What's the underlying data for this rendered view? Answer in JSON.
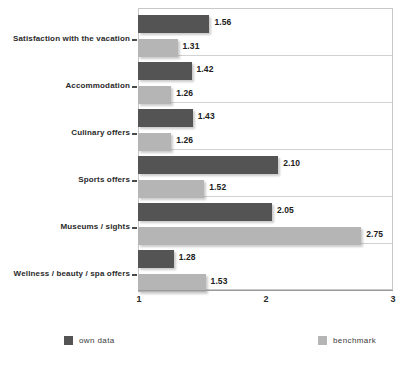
{
  "chart_data": {
    "type": "bar",
    "orientation": "horizontal",
    "title": "",
    "xlabel": "",
    "ylabel": "",
    "xlim": [
      1,
      3
    ],
    "xticks": [
      "1",
      "2",
      "3"
    ],
    "grid": true,
    "legend_position": "bottom",
    "categories": [
      "Satisfaction with the vacation",
      "Accommodation",
      "Culinary offers",
      "Sports offers",
      "Museums / sights",
      "Wellness / beauty / spa offers"
    ],
    "series": [
      {
        "name": "own data",
        "color": "#545454",
        "values": [
          1.56,
          1.42,
          1.43,
          2.1,
          2.05,
          1.28
        ],
        "labels": [
          "1.56",
          "1.42",
          "1.43",
          "2.10",
          "2.05",
          "1.28"
        ]
      },
      {
        "name": "benchmark",
        "color": "#b5b5b5",
        "values": [
          1.31,
          1.26,
          1.26,
          1.52,
          2.75,
          1.53
        ],
        "labels": [
          "1.31",
          "1.26",
          "1.26",
          "1.52",
          "2.75",
          "1.53"
        ]
      }
    ]
  },
  "legend": {
    "own_label": "own data",
    "bench_label": "benchmark"
  }
}
